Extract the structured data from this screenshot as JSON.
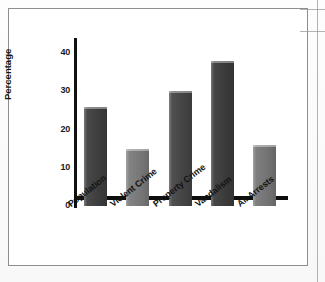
{
  "figure": {
    "has_outer_frame": true,
    "frame_color": "#8e8e8e",
    "background_color": "#ffffff"
  },
  "chart_data": {
    "type": "bar",
    "title": "",
    "xlabel": "",
    "ylabel": "Percentage",
    "categories": [
      "Population",
      "Violent Crime",
      "Property Crime",
      "Vandalism",
      "All Arrests"
    ],
    "values": [
      26,
      15,
      30,
      38,
      16
    ],
    "ylim": [
      0,
      44
    ],
    "yticks": [
      0,
      10,
      20,
      30,
      40
    ],
    "ytick_labels": [
      "0",
      "10",
      "20",
      "30",
      "40"
    ],
    "grid": false,
    "legend": null,
    "bar_colors": [
      "#3f3f3f",
      "#7c7c7c",
      "#464646",
      "#3c3c3c",
      "#787878"
    ],
    "axis_color": "#111111"
  }
}
